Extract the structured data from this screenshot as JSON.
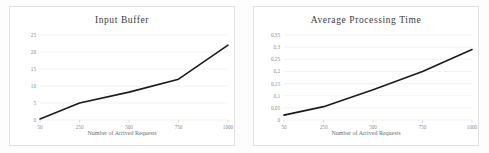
{
  "page": {
    "background": "#fdfdfd",
    "panel_border_color": "#e2e2e2",
    "gridline_color": "#ededed",
    "line_color": "#1a1a1a",
    "tick_text_color": "#8a8a8a",
    "title_text_color": "#3a3a3a"
  },
  "chart_data": [
    {
      "type": "line",
      "title": "Input Buffer",
      "xlabel": "Number of Arrived Requests",
      "ylabel": "",
      "categories": [
        "50",
        "250",
        "500",
        "750",
        "1000"
      ],
      "x": [
        50,
        250,
        500,
        750,
        1000
      ],
      "values": [
        0.3,
        5,
        8.2,
        12,
        22
      ],
      "xticks": [
        "50",
        "250",
        "500",
        "750",
        "1000"
      ],
      "yticks": [
        "0",
        "5",
        "10",
        "15",
        "20",
        "25"
      ],
      "ytick_values": [
        0,
        5,
        10,
        15,
        20,
        25
      ],
      "ylim": [
        0,
        25
      ],
      "xlim": [
        50,
        1000
      ],
      "grid": true,
      "legend": "none",
      "series": [
        {
          "name": "Input Buffer",
          "values": [
            0.3,
            5,
            8.2,
            12,
            22
          ]
        }
      ]
    },
    {
      "type": "line",
      "title": "Average Processing Time",
      "xlabel": "Number of Arrived Requests",
      "ylabel": "",
      "categories": [
        "50",
        "250",
        "500",
        "750",
        "1000"
      ],
      "x": [
        50,
        250,
        500,
        750,
        1000
      ],
      "values": [
        0.02,
        0.055,
        0.125,
        0.2,
        0.29
      ],
      "xticks": [
        "50",
        "250",
        "500",
        "750",
        "1000"
      ],
      "yticks": [
        "0",
        "0,05",
        "0,1",
        "0,15",
        "0,2",
        "0,25",
        "0,3",
        "0,35"
      ],
      "ytick_values": [
        0,
        0.05,
        0.1,
        0.15,
        0.2,
        0.25,
        0.3,
        0.35
      ],
      "ylim": [
        0,
        0.35
      ],
      "xlim": [
        50,
        1000
      ],
      "grid": true,
      "legend": "none",
      "series": [
        {
          "name": "Average Processing Time",
          "values": [
            0.02,
            0.055,
            0.125,
            0.2,
            0.29
          ]
        }
      ]
    }
  ]
}
